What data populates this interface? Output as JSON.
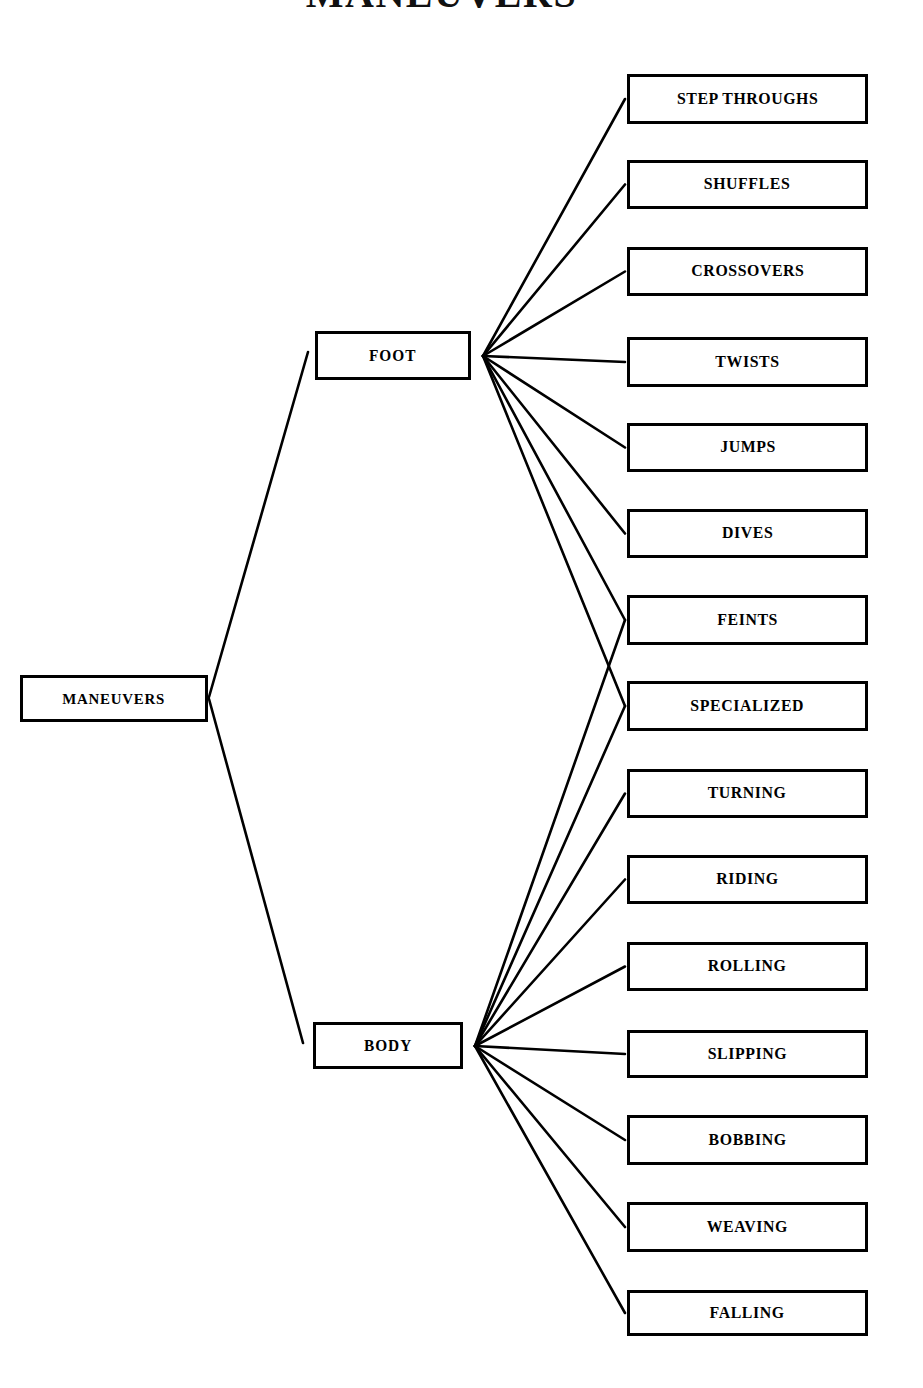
{
  "title": "MANEUVERS",
  "diagram": {
    "type": "tree",
    "orientation": "left-to-right",
    "root": {
      "id": "maneuvers",
      "label": "MANEUVERS",
      "x": 20,
      "y": 675,
      "w": 188,
      "h": 47
    },
    "branches": [
      {
        "id": "foot",
        "label": "FOOT",
        "x": 315,
        "y": 331,
        "w": 156,
        "h": 49,
        "hub_x": 483,
        "hub_y": 356
      },
      {
        "id": "body",
        "label": "BODY",
        "x": 313,
        "y": 1022,
        "w": 150,
        "h": 47,
        "hub_x": 475,
        "hub_y": 1046
      }
    ],
    "leaves": [
      {
        "id": "step-throughs",
        "label": "STEP THROUGHS",
        "x": 627,
        "y": 74,
        "w": 241,
        "h": 50,
        "parents": [
          "foot"
        ]
      },
      {
        "id": "shuffles",
        "label": "SHUFFLES",
        "x": 627,
        "y": 160,
        "w": 241,
        "h": 49,
        "parents": [
          "foot"
        ]
      },
      {
        "id": "crossovers",
        "label": "CROSSOVERS",
        "x": 627,
        "y": 247,
        "w": 241,
        "h": 49,
        "parents": [
          "foot"
        ]
      },
      {
        "id": "twists",
        "label": "TWISTS",
        "x": 627,
        "y": 337,
        "w": 241,
        "h": 50,
        "parents": [
          "foot"
        ]
      },
      {
        "id": "jumps",
        "label": "JUMPS",
        "x": 627,
        "y": 423,
        "w": 241,
        "h": 49,
        "parents": [
          "foot"
        ]
      },
      {
        "id": "dives",
        "label": "DIVES",
        "x": 627,
        "y": 509,
        "w": 241,
        "h": 49,
        "parents": [
          "foot"
        ]
      },
      {
        "id": "feints",
        "label": "FEINTS",
        "x": 627,
        "y": 595,
        "w": 241,
        "h": 50,
        "parents": [
          "foot",
          "body"
        ]
      },
      {
        "id": "specialized",
        "label": "SPECIALIZED",
        "x": 627,
        "y": 681,
        "w": 241,
        "h": 50,
        "parents": [
          "foot",
          "body"
        ]
      },
      {
        "id": "turning",
        "label": "TURNING",
        "x": 627,
        "y": 769,
        "w": 241,
        "h": 49,
        "parents": [
          "body"
        ]
      },
      {
        "id": "riding",
        "label": "RIDING",
        "x": 627,
        "y": 855,
        "w": 241,
        "h": 49,
        "parents": [
          "body"
        ]
      },
      {
        "id": "rolling",
        "label": "ROLLING",
        "x": 627,
        "y": 942,
        "w": 241,
        "h": 49,
        "parents": [
          "body"
        ]
      },
      {
        "id": "slipping",
        "label": "SLIPPING",
        "x": 627,
        "y": 1030,
        "w": 241,
        "h": 48,
        "parents": [
          "body"
        ]
      },
      {
        "id": "bobbing",
        "label": "BOBBING",
        "x": 627,
        "y": 1115,
        "w": 241,
        "h": 50,
        "parents": [
          "body"
        ]
      },
      {
        "id": "weaving",
        "label": "WEAVING",
        "x": 627,
        "y": 1202,
        "w": 241,
        "h": 50,
        "parents": [
          "body"
        ]
      },
      {
        "id": "falling",
        "label": "FALLING",
        "x": 627,
        "y": 1290,
        "w": 241,
        "h": 46,
        "parents": [
          "body"
        ]
      }
    ],
    "root_links": [
      {
        "from": "maneuvers",
        "to": "foot",
        "x1": 209,
        "y1": 697,
        "x2": 308,
        "y2": 352
      },
      {
        "from": "maneuvers",
        "to": "body",
        "x1": 209,
        "y1": 699,
        "x2": 303,
        "y2": 1043
      }
    ],
    "style": {
      "line_color": "#000000",
      "box_border_color": "#000000",
      "box_fill": "#ffffff",
      "background": "#ffffff"
    }
  }
}
